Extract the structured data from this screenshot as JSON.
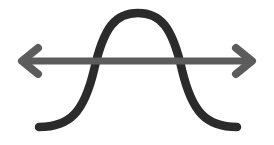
{
  "icon": {
    "name": "bell-curve-range-icon",
    "colors": {
      "curve": "#2b2b2b",
      "arrow": "#5c5c5c",
      "background": "#ffffff"
    }
  }
}
